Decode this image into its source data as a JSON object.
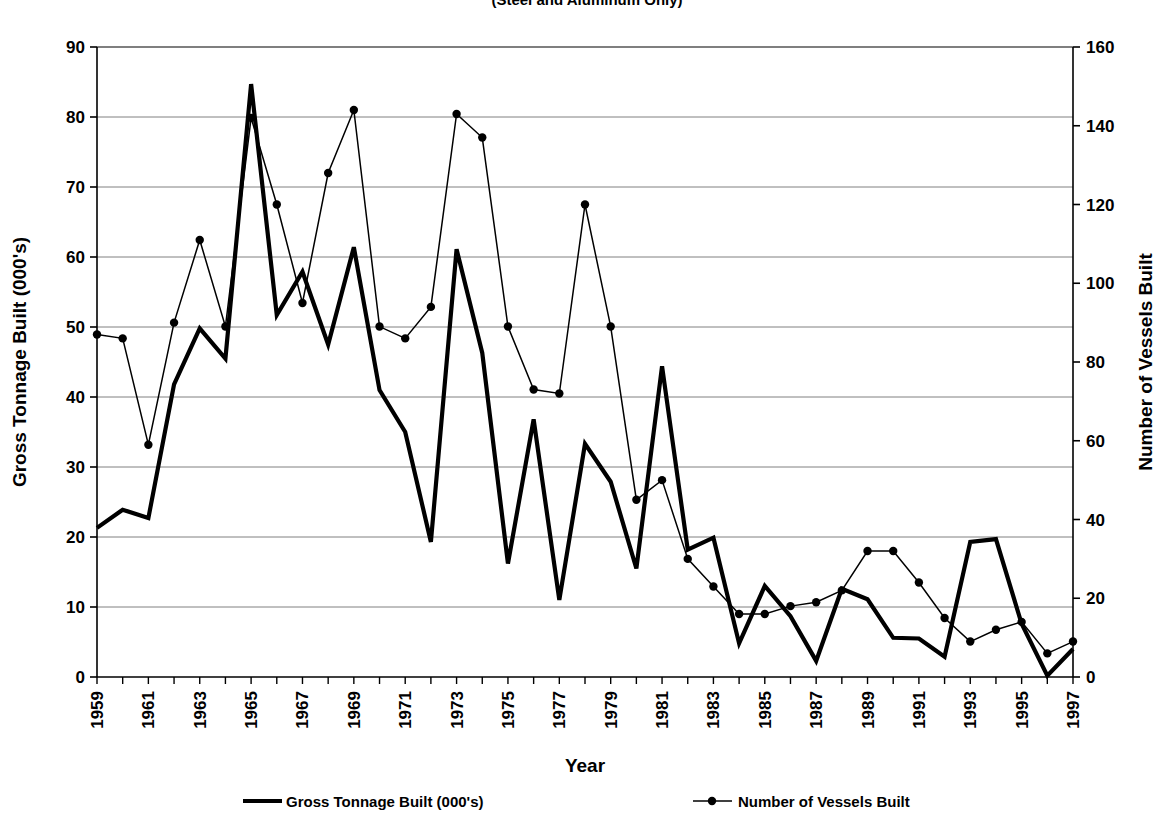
{
  "title": {
    "subtitle": "(Steel and Aluminum Only)"
  },
  "axes": {
    "left_title": "Gross Tonnage Built (000's)",
    "right_title": "Number of Vessels Built",
    "x_title": "Year",
    "left_ticks": [
      "0",
      "10",
      "20",
      "30",
      "40",
      "50",
      "60",
      "70",
      "80",
      "90"
    ],
    "right_ticks": [
      "0",
      "20",
      "40",
      "60",
      "80",
      "100",
      "120",
      "140",
      "160"
    ],
    "x_ticks": [
      "1959",
      "1961",
      "1963",
      "1965",
      "1967",
      "1969",
      "1971",
      "1973",
      "1975",
      "1977",
      "1979",
      "1981",
      "1983",
      "1985",
      "1987",
      "1989",
      "1991",
      "1993",
      "1995",
      "1997"
    ]
  },
  "legend": {
    "items": [
      {
        "label": "Gross Tonnage Built (000's)",
        "marker": "thick-line",
        "color": "#000000"
      },
      {
        "label": "Number of Vessels Built",
        "marker": "line-with-dot",
        "color": "#000000"
      }
    ]
  },
  "chart_data": {
    "type": "line",
    "title": "",
    "subtitle": "(Steel and Aluminum Only)",
    "xlabel": "Year",
    "ylabel": "Gross Tonnage Built (000's)",
    "y2label": "Number of Vessels Built",
    "ylim": [
      0,
      90
    ],
    "y2lim": [
      0,
      160
    ],
    "ytick_step": 10,
    "y2tick_step": 20,
    "grid": true,
    "legend_position": "bottom",
    "x": [
      1959,
      1960,
      1961,
      1962,
      1963,
      1964,
      1965,
      1966,
      1967,
      1968,
      1969,
      1970,
      1971,
      1972,
      1973,
      1974,
      1975,
      1976,
      1977,
      1978,
      1979,
      1980,
      1981,
      1982,
      1983,
      1984,
      1985,
      1986,
      1987,
      1988,
      1989,
      1990,
      1991,
      1992,
      1993,
      1994,
      1995,
      1996,
      1997
    ],
    "series": [
      {
        "name": "Gross Tonnage Built (000's)",
        "axis": "left",
        "marker": false,
        "line_width": "thick",
        "values": [
          21.3,
          23.9,
          22.7,
          41.8,
          49.8,
          45.5,
          84.7,
          51.7,
          57.9,
          47.5,
          61.4,
          41.0,
          35.0,
          19.3,
          61.1,
          46.3,
          16.2,
          36.8,
          11.0,
          33.3,
          27.9,
          15.5,
          44.4,
          18.2,
          19.9,
          4.8,
          13.0,
          8.7,
          2.3,
          12.6,
          11.1,
          5.6,
          5.5,
          2.9,
          19.3,
          19.7,
          7.6,
          0.2,
          4.0
        ]
      },
      {
        "name": "Number of Vessels Built",
        "axis": "right",
        "marker": true,
        "line_width": "thin",
        "values": [
          87,
          86,
          59,
          90,
          111,
          89,
          142,
          120,
          95,
          128,
          144,
          89,
          86,
          94,
          143,
          137,
          89,
          73,
          72,
          120,
          89,
          45,
          50,
          30,
          23,
          16,
          16,
          18,
          19,
          22,
          32,
          32,
          24,
          15,
          9,
          12,
          14,
          6,
          9
        ]
      }
    ]
  }
}
